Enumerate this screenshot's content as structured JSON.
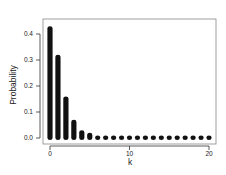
{
  "chart_data": {
    "type": "bar",
    "title": "",
    "xlabel": "k",
    "ylabel": "Probability",
    "categories": [
      0,
      1,
      2,
      3,
      4,
      5,
      6,
      7,
      8,
      9,
      10,
      11,
      12,
      13,
      14,
      15,
      16,
      17,
      18,
      19,
      20
    ],
    "values": [
      0.43,
      0.32,
      0.16,
      0.07,
      0.03,
      0.02,
      0.01,
      0.01,
      0.01,
      0.01,
      0.01,
      0.01,
      0.01,
      0.01,
      0.01,
      0.01,
      0.01,
      0.01,
      0.01,
      0.01,
      0.01
    ],
    "xticks": [
      0,
      10,
      20
    ],
    "xtick_labels": [
      "0",
      "10",
      "20"
    ],
    "yticks": [
      0.0,
      0.1,
      0.2,
      0.3,
      0.4
    ],
    "ytick_labels": [
      "0.0",
      "0.1",
      "0.2",
      "0.3",
      "0.4"
    ],
    "ylim": [
      0,
      0.45
    ],
    "xlim": [
      -1,
      21
    ],
    "grid": false,
    "legend": null,
    "bar_color": "#111111"
  }
}
